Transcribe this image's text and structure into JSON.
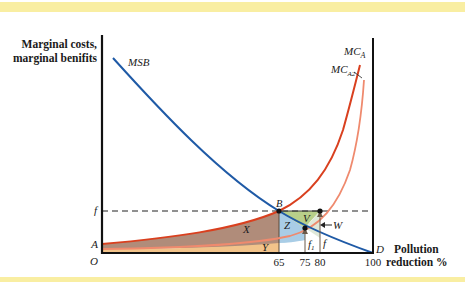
{
  "diagram": {
    "y_axis_label_line1": "Marginal costs,",
    "y_axis_label_line2": "marginal benifits",
    "x_axis_label_line1": "Pollution",
    "x_axis_label_line2": "reduction %",
    "curves": {
      "msb": "MSB",
      "mca_main": "MC",
      "mca_main_sub": "A",
      "mca2_main": "MC",
      "mca2_sub": "A2"
    },
    "points": {
      "origin": "O",
      "a": "A",
      "b": "B",
      "d": "D",
      "f": "f"
    },
    "areas": {
      "x": "X",
      "y": "Y",
      "z": "Z",
      "v": "V",
      "w": "W"
    },
    "arrows": {
      "f1": "f",
      "f1_sub": "1",
      "f": "f"
    },
    "x_ticks": [
      "65",
      "75",
      "80",
      "100"
    ],
    "colors": {
      "msb": "#1f5aa6",
      "mca": "#d9401f",
      "mca2": "#ef8a6e",
      "area_x": "#b08c7a",
      "area_y": "#f2c38a",
      "area_z": "#a9cde6",
      "area_v": "#b8cf8a",
      "band": "#f9eea2"
    }
  }
}
